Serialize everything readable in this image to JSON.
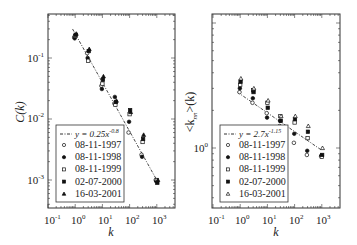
{
  "chart_data": [
    {
      "type": "scatter",
      "title": "",
      "xlabel": "k",
      "ylabel": "C(k)",
      "xscale": "log",
      "yscale": "log",
      "xlim": [
        0.1,
        4500
      ],
      "ylim": [
        0.00034,
        0.53
      ],
      "x_ticks": [
        "10^-1",
        "10^0",
        "10^1",
        "10^2",
        "10^3"
      ],
      "y_ticks": [
        "10^-3",
        "10^-2",
        "10^-1"
      ],
      "grid": false,
      "legend_position": "lower left",
      "fit": {
        "label": "y = 0.25x^-0.8",
        "a": 0.25,
        "b": -0.8,
        "style": "dash-dot"
      },
      "x": [
        1,
        3,
        10,
        30,
        100,
        300,
        1000
      ],
      "series": [
        {
          "name": "08-11-1997",
          "marker": "circle-open",
          "values": [
            0.22,
            0.12,
            0.035,
            0.018,
            0.006,
            0.0026,
            0.001
          ]
        },
        {
          "name": "08-11-1998",
          "marker": "circle-filled",
          "values": [
            0.21,
            0.1,
            0.031,
            0.023,
            0.009,
            0.0024,
            0.00095
          ]
        },
        {
          "name": "08-11-1999",
          "marker": "square-open",
          "values": [
            0.23,
            0.09,
            0.038,
            0.017,
            0.012,
            0.0042,
            0.001
          ]
        },
        {
          "name": "02-07-2000",
          "marker": "square-filled",
          "values": [
            0.24,
            0.13,
            0.044,
            0.019,
            0.014,
            0.0047,
            0.0009
          ]
        },
        {
          "name": "16-03-2001",
          "marker": "triangle-filled",
          "values": [
            0.25,
            0.14,
            0.05,
            0.02,
            0.013,
            0.0055,
            0.001
          ]
        }
      ]
    },
    {
      "type": "scatter",
      "title": "",
      "xlabel": "k",
      "ylabel": "<k_nn>(k)",
      "xscale": "log",
      "yscale": "log",
      "xlim": [
        0.1,
        4500
      ],
      "ylim": [
        0.4,
        7
      ],
      "x_ticks": [
        "10^-1",
        "10^0",
        "10^1",
        "10^2",
        "10^3"
      ],
      "y_ticks": [
        "10^0"
      ],
      "grid": false,
      "legend_position": "lower left",
      "fit": {
        "label": "y = 2.7x^-1.15",
        "a": 2.7,
        "b": -0.15,
        "style": "dash-dot"
      },
      "x": [
        1,
        3,
        10,
        30,
        100,
        300,
        1000
      ],
      "series": [
        {
          "name": "08-11-1997",
          "marker": "circle-open",
          "values": [
            2.8,
            2.3,
            1.9,
            1.5,
            1.1,
            0.88,
            0.86
          ]
        },
        {
          "name": "08-11-1998",
          "marker": "circle-filled",
          "values": [
            3.0,
            2.5,
            1.75,
            1.65,
            1.3,
            0.95,
            0.87
          ]
        },
        {
          "name": "08-11-1999",
          "marker": "square-open",
          "values": [
            3.2,
            2.9,
            2.3,
            1.8,
            1.6,
            1.2,
            0.85
          ]
        },
        {
          "name": "02-07-2000",
          "marker": "square-filled",
          "values": [
            3.4,
            2.8,
            2.1,
            1.65,
            1.7,
            1.35,
            0.88
          ]
        },
        {
          "name": "16-03-2001",
          "marker": "triangle-open",
          "values": [
            3.6,
            3.0,
            2.4,
            1.8,
            1.8,
            1.5,
            1.0
          ]
        }
      ]
    }
  ],
  "panels": [
    {
      "ylabel": "C(k)",
      "xlabel": "k",
      "xtick_labels": [
        {
          "base": "10",
          "exp": "-1"
        },
        {
          "base": "10",
          "exp": "0"
        },
        {
          "base": "10",
          "exp": "1"
        },
        {
          "base": "10",
          "exp": "2"
        },
        {
          "base": "10",
          "exp": "3"
        }
      ],
      "ytick_labels": [
        {
          "base": "10",
          "exp": "-1"
        },
        {
          "base": "10",
          "exp": "-2"
        },
        {
          "base": "10",
          "exp": "-3"
        }
      ],
      "legend": {
        "fit_label": "y = 0.25x",
        "fit_exp": "-0.8",
        "entries": [
          "08-11-1997",
          "08-11-1998",
          "08-11-1999",
          "02-07-2000",
          "16-03-2001"
        ]
      }
    },
    {
      "ylabel": "<k",
      "ylabel_sub": "nn",
      "ylabel_tail": ">(k)",
      "xlabel": "k",
      "xtick_labels": [
        {
          "base": "10",
          "exp": "-1"
        },
        {
          "base": "10",
          "exp": "0"
        },
        {
          "base": "10",
          "exp": "1"
        },
        {
          "base": "10",
          "exp": "2"
        },
        {
          "base": "10",
          "exp": "3"
        }
      ],
      "ytick_labels": [
        {
          "base": "10",
          "exp": "0"
        }
      ],
      "legend": {
        "fit_label": "y = 2.7x",
        "fit_exp": "-1.15",
        "entries": [
          "08-11-1997",
          "08-11-1998",
          "08-11-1999",
          "02-07-2000",
          "16-03-2001"
        ]
      }
    }
  ]
}
